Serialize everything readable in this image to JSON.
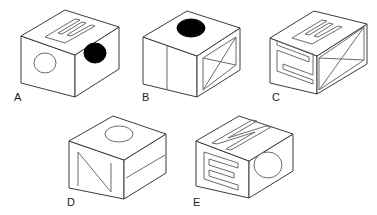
{
  "figure": {
    "background_color": "#ffffff",
    "edge_color": "#3c3c3c",
    "mark_color": "#6b6b6b",
    "filled_color": "#000000",
    "label_color": "#1a1a1a",
    "cube_count": 5
  },
  "cubes": [
    {
      "id": "A",
      "label": "A",
      "label_x": 14,
      "label_y": 101,
      "origin_x": 14,
      "origin_y": 8,
      "faces": {
        "top": {
          "symbol": "letter-E",
          "style": "outline"
        },
        "left": {
          "symbol": "circle",
          "style": "open"
        },
        "right": {
          "symbol": "circle",
          "style": "filled"
        }
      }
    },
    {
      "id": "B",
      "label": "B",
      "label_x": 142,
      "label_y": 101,
      "origin_x": 140,
      "origin_y": 8,
      "faces": {
        "top": {
          "symbol": "circle",
          "style": "filled"
        },
        "left": {
          "symbol": "vertical-bar",
          "style": "line"
        },
        "right": {
          "symbol": "x-cross",
          "style": "outline"
        }
      }
    },
    {
      "id": "C",
      "label": "C",
      "label_x": 272,
      "label_y": 101,
      "origin_x": 268,
      "origin_y": 8,
      "faces": {
        "top": {
          "symbol": "letter-E",
          "style": "outline"
        },
        "left": {
          "symbol": "letter-N",
          "style": "outline"
        },
        "right": {
          "symbol": "x-cross",
          "style": "outline"
        }
      }
    },
    {
      "id": "D",
      "label": "D",
      "label_x": 67,
      "label_y": 206,
      "origin_x": 66,
      "origin_y": 113,
      "faces": {
        "top": {
          "symbol": "circle",
          "style": "open"
        },
        "left": {
          "symbol": "letter-N",
          "style": "line"
        },
        "right": {
          "symbol": "horizontal-bar",
          "style": "line"
        }
      }
    },
    {
      "id": "E",
      "label": "E",
      "label_x": 193,
      "label_y": 206,
      "origin_x": 192,
      "origin_y": 113,
      "faces": {
        "top": {
          "symbol": "letter-N",
          "style": "outline"
        },
        "left": {
          "symbol": "letter-E",
          "style": "outline"
        },
        "right": {
          "symbol": "circle",
          "style": "open"
        }
      }
    }
  ],
  "labels": {
    "a": "A",
    "b": "B",
    "c": "C",
    "d": "D",
    "e": "E"
  }
}
